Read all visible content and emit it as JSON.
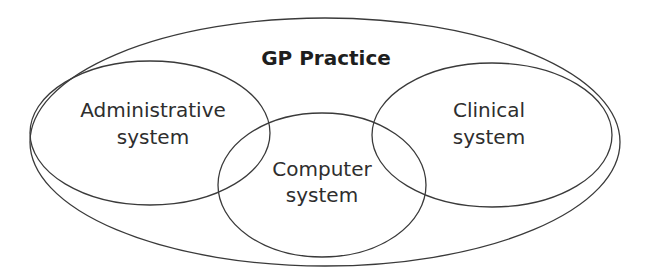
{
  "diagram": {
    "title": "GP Practice",
    "sets": [
      {
        "id": "administrative",
        "label_line1": "Administrative",
        "label_line2": "system"
      },
      {
        "id": "clinical",
        "label_line1": "Clinical",
        "label_line2": "system"
      },
      {
        "id": "computer",
        "label_line1": "Computer",
        "label_line2": "system"
      }
    ],
    "container": {
      "id": "gp-practice",
      "label": "GP Practice"
    },
    "colors": {
      "stroke": "#3a3a3a",
      "text": "#2e2e2e",
      "background": "#ffffff"
    }
  }
}
